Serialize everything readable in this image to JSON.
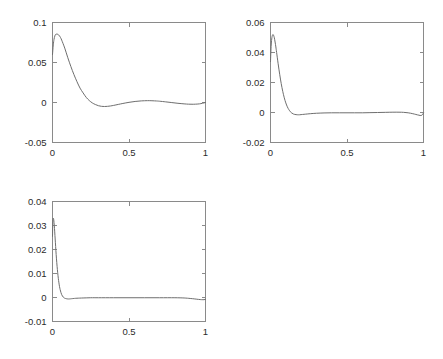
{
  "figure": {
    "background": "#ffffff",
    "axis_color": "#8a8a8a",
    "curve_color": "#6e6e6e",
    "label_color": "#2b2b2b",
    "layout": "2x2 grid, bottom-right empty"
  },
  "chart_data": [
    {
      "type": "line",
      "id": "subplot-1",
      "position": "top-left",
      "title": "",
      "xlabel": "",
      "ylabel": "",
      "xlim": [
        0,
        1
      ],
      "ylim": [
        -0.05,
        0.1
      ],
      "xticks": [
        0,
        0.5,
        1
      ],
      "xticklabels": [
        "0",
        "0.5",
        "1"
      ],
      "yticks": [
        -0.05,
        0,
        0.05,
        0.1
      ],
      "yticklabels": [
        "-0.05",
        "0",
        "0.05",
        "0.1"
      ],
      "grid": false,
      "legend": null,
      "series": [
        {
          "name": "residual",
          "x": [
            0.0,
            0.005,
            0.01,
            0.015,
            0.02,
            0.03,
            0.04,
            0.05,
            0.06,
            0.08,
            0.1,
            0.12,
            0.14,
            0.16,
            0.18,
            0.2,
            0.22,
            0.24,
            0.26,
            0.28,
            0.3,
            0.32,
            0.34,
            0.36,
            0.38,
            0.4,
            0.43,
            0.46,
            0.5,
            0.54,
            0.58,
            0.62,
            0.65,
            0.68,
            0.7,
            0.74,
            0.78,
            0.82,
            0.86,
            0.89,
            0.92,
            0.95,
            0.97,
            0.99,
            1.0
          ],
          "y": [
            0.06,
            0.072,
            0.079,
            0.083,
            0.085,
            0.0855,
            0.0845,
            0.082,
            0.078,
            0.068,
            0.056,
            0.045,
            0.035,
            0.026,
            0.018,
            0.012,
            0.0065,
            0.0025,
            -0.0005,
            -0.0025,
            -0.004,
            -0.0048,
            -0.005,
            -0.0048,
            -0.0043,
            -0.0036,
            -0.0024,
            -0.0012,
            0.0002,
            0.0013,
            0.002,
            0.0023,
            0.0022,
            0.0019,
            0.0016,
            0.0008,
            -0.0001,
            -0.001,
            -0.0017,
            -0.0021,
            -0.0022,
            -0.0019,
            -0.0014,
            -0.0005,
            0.0
          ]
        }
      ]
    },
    {
      "type": "line",
      "id": "subplot-2",
      "position": "top-right",
      "title": "",
      "xlabel": "",
      "ylabel": "",
      "xlim": [
        0,
        1
      ],
      "ylim": [
        -0.02,
        0.06
      ],
      "xticks": [
        0,
        0.5,
        1
      ],
      "xticklabels": [
        "0",
        "0.5",
        "1"
      ],
      "yticks": [
        -0.02,
        0,
        0.02,
        0.04,
        0.06
      ],
      "yticklabels": [
        "-0.02",
        "0",
        "0.02",
        "0.04",
        "0.06"
      ],
      "grid": false,
      "legend": null,
      "series": [
        {
          "name": "residual",
          "x": [
            0.0,
            0.004,
            0.008,
            0.012,
            0.016,
            0.02,
            0.025,
            0.03,
            0.035,
            0.04,
            0.05,
            0.06,
            0.07,
            0.08,
            0.09,
            0.1,
            0.11,
            0.12,
            0.13,
            0.14,
            0.15,
            0.16,
            0.175,
            0.19,
            0.21,
            0.23,
            0.26,
            0.3,
            0.35,
            0.4,
            0.45,
            0.5,
            0.55,
            0.6,
            0.65,
            0.7,
            0.75,
            0.8,
            0.84,
            0.87,
            0.9,
            0.93,
            0.95,
            0.97,
            0.985,
            0.995,
            1.0
          ],
          "y": [
            0.034,
            0.044,
            0.049,
            0.0513,
            0.052,
            0.0515,
            0.0498,
            0.047,
            0.0437,
            0.04,
            0.0325,
            0.0255,
            0.0193,
            0.0141,
            0.0098,
            0.0064,
            0.0038,
            0.0019,
            0.0005,
            -0.0004,
            -0.001,
            -0.0013,
            -0.0015,
            -0.0015,
            -0.0013,
            -0.0011,
            -0.0008,
            -0.0005,
            -0.0003,
            -0.0002,
            -0.0002,
            -0.0002,
            -0.0002,
            -0.0002,
            -0.0001,
            0.0,
            0.0001,
            0.0002,
            0.0002,
            0.0001,
            -0.0002,
            -0.0008,
            -0.0013,
            -0.0018,
            -0.002,
            -0.0012,
            -0.0002
          ]
        }
      ]
    },
    {
      "type": "line",
      "id": "subplot-3",
      "position": "bottom-left",
      "title": "",
      "xlabel": "",
      "ylabel": "",
      "xlim": [
        0,
        1
      ],
      "ylim": [
        -0.01,
        0.04
      ],
      "xticks": [
        0,
        0.5,
        1
      ],
      "xticklabels": [
        "0",
        "0.5",
        "1"
      ],
      "yticks": [
        -0.01,
        0,
        0.01,
        0.02,
        0.03,
        0.04
      ],
      "yticklabels": [
        "-0.01",
        "0",
        "0.01",
        "0.02",
        "0.03",
        "0.04"
      ],
      "grid": false,
      "legend": null,
      "series": [
        {
          "name": "residual",
          "x": [
            0.0,
            0.002,
            0.004,
            0.006,
            0.008,
            0.01,
            0.013,
            0.016,
            0.019,
            0.022,
            0.026,
            0.03,
            0.034,
            0.038,
            0.042,
            0.046,
            0.05,
            0.055,
            0.06,
            0.065,
            0.07,
            0.075,
            0.08,
            0.09,
            0.1,
            0.11,
            0.125,
            0.14,
            0.16,
            0.2,
            0.25,
            0.3,
            0.4,
            0.5,
            0.6,
            0.7,
            0.8,
            0.86,
            0.9,
            0.93,
            0.955,
            0.975,
            0.99,
            1.0
          ],
          "y": [
            0.0255,
            0.031,
            0.0328,
            0.033,
            0.0324,
            0.0312,
            0.0288,
            0.0258,
            0.0228,
            0.0197,
            0.0161,
            0.013,
            0.0103,
            0.008,
            0.0061,
            0.0045,
            0.0033,
            0.0021,
            0.0012,
            0.0006,
            0.0002,
            -0.0001,
            -0.0003,
            -0.0005,
            -0.0006,
            -0.0006,
            -0.0005,
            -0.0004,
            -0.0003,
            -0.0002,
            -0.0001,
            -0.0001,
            -0.0001,
            -0.0001,
            -0.0001,
            -0.0001,
            -0.0001,
            -0.0002,
            -0.0004,
            -0.0006,
            -0.0008,
            -0.0009,
            -0.0009,
            -0.0008
          ]
        }
      ]
    }
  ]
}
